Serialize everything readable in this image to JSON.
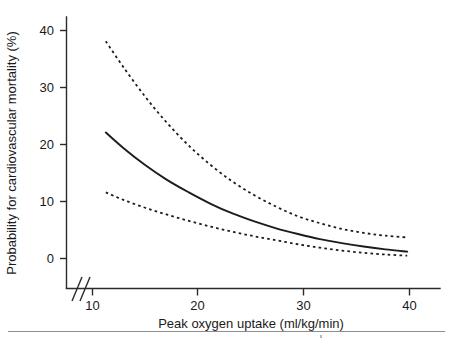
{
  "chart_data": {
    "type": "line",
    "title": "",
    "subtitle": "",
    "xlabel": "Peak oxygen uptake (ml/kg/min)",
    "ylabel": "Probability for cardiovascular mortality (%)",
    "xlim": [
      8.8,
      43.0
    ],
    "ylim": [
      -1.6,
      44.5
    ],
    "x_ticks": [
      10,
      20,
      30,
      40
    ],
    "x_tick_labels": [
      "10",
      "20",
      "30",
      "40"
    ],
    "y_ticks": [
      0,
      10,
      20,
      30,
      40
    ],
    "y_tick_labels": [
      "0",
      "10",
      "20",
      "30",
      "40"
    ],
    "grid": false,
    "legend": "none",
    "axis_break": {
      "axis": "x",
      "symbol": "//",
      "position_value": 9.3,
      "note": "double slash break between origin and first tick"
    },
    "annotations": [],
    "series": [
      {
        "name": "Upper 95% confidence limit",
        "style": "dashed",
        "x": [
          12.4,
          14,
          16,
          18,
          20,
          22,
          24,
          26,
          28,
          30,
          32,
          34,
          36,
          38,
          40
        ],
        "y": [
          38.1,
          33.6,
          28.4,
          23.8,
          19.8,
          16.4,
          13.5,
          11.1,
          9.1,
          7.4,
          6.2,
          5.2,
          4.5,
          4.0,
          3.7
        ]
      },
      {
        "name": "Predicted probability",
        "style": "solid",
        "x": [
          12.4,
          14,
          16,
          18,
          20,
          22,
          24,
          26,
          28,
          30,
          32,
          34,
          36,
          38,
          40
        ],
        "y": [
          22.1,
          19.4,
          16.4,
          13.8,
          11.6,
          9.6,
          7.9,
          6.5,
          5.3,
          4.3,
          3.4,
          2.7,
          2.1,
          1.6,
          1.2
        ]
      },
      {
        "name": "Lower 95% confidence limit",
        "style": "dashed",
        "x": [
          12.4,
          14,
          16,
          18,
          20,
          22,
          24,
          26,
          28,
          30,
          32,
          34,
          36,
          38,
          40
        ],
        "y": [
          11.6,
          10.3,
          8.9,
          7.7,
          6.6,
          5.6,
          4.7,
          3.9,
          3.2,
          2.5,
          1.9,
          1.4,
          1.0,
          0.7,
          0.5
        ]
      }
    ],
    "colors": {
      "curve": "#1c1c1c",
      "axis": "#2b2b2b",
      "background": "#ffffff",
      "footer_rule": "#8c8c8c"
    }
  },
  "footer": {
    "rule_present": "true"
  }
}
